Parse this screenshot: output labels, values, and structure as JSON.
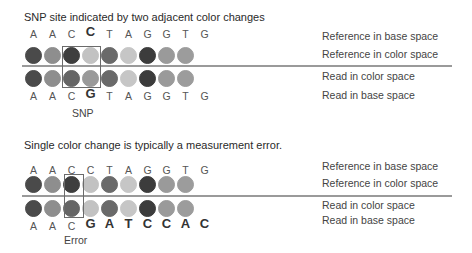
{
  "panels": [
    {
      "title": "SNP site indicated by two adjacent color changes",
      "ref_bases": [
        {
          "b": "A",
          "big": false
        },
        {
          "b": "A",
          "big": false
        },
        {
          "b": "C",
          "big": false
        },
        {
          "b": "C",
          "big": true
        },
        {
          "b": "T",
          "big": false
        },
        {
          "b": "A",
          "big": false
        },
        {
          "b": "G",
          "big": false
        },
        {
          "b": "G",
          "big": false
        },
        {
          "b": "T",
          "big": false
        },
        {
          "b": "G",
          "big": false
        }
      ],
      "ref_colors": [
        "#4a4a4a",
        "#8e8e8e",
        "#3e3e3e",
        "#c2c2c2",
        "#6a6a6a",
        "#c6c6c6",
        "#3c3c3c",
        "#9a9a9a",
        "#9c9c9c"
      ],
      "read_colors": [
        "#4a4a4a",
        "#8e8e8e",
        "#666666",
        "#9a9a9a",
        "#6a6a6a",
        "#c6c6c6",
        "#3c3c3c",
        "#9a9a9a",
        "#9c9c9c"
      ],
      "read_bases": [
        {
          "b": "A",
          "big": false
        },
        {
          "b": "A",
          "big": false
        },
        {
          "b": "C",
          "big": false
        },
        {
          "b": "G",
          "big": true
        },
        {
          "b": "T",
          "big": false
        },
        {
          "b": "A",
          "big": false
        },
        {
          "b": "G",
          "big": false
        },
        {
          "b": "G",
          "big": false
        },
        {
          "b": "T",
          "big": false
        },
        {
          "b": "G",
          "big": false
        }
      ],
      "caption": "SNP",
      "labels": {
        "ref_base": "Reference in base space",
        "ref_color": "Reference in color space",
        "read_color": "Read in color space",
        "read_base": "Read in base space"
      }
    },
    {
      "title": "Single color change is typically a measurement error.",
      "ref_bases": [
        {
          "b": "A",
          "big": false
        },
        {
          "b": "A",
          "big": false
        },
        {
          "b": "C",
          "big": false
        },
        {
          "b": "C",
          "big": false
        },
        {
          "b": "T",
          "big": false
        },
        {
          "b": "A",
          "big": false
        },
        {
          "b": "G",
          "big": false
        },
        {
          "b": "G",
          "big": false
        },
        {
          "b": "T",
          "big": false
        },
        {
          "b": "G",
          "big": false
        }
      ],
      "ref_colors": [
        "#4a4a4a",
        "#8e8e8e",
        "#3e3e3e",
        "#c2c2c2",
        "#6a6a6a",
        "#c6c6c6",
        "#3c3c3c",
        "#9a9a9a",
        "#9c9c9c"
      ],
      "read_colors": [
        "#4a4a4a",
        "#8e8e8e",
        "#666666",
        "#c2c2c2",
        "#6a6a6a",
        "#c6c6c6",
        "#3c3c3c",
        "#9a9a9a",
        "#9c9c9c"
      ],
      "read_bases": [
        {
          "b": "A",
          "big": false
        },
        {
          "b": "A",
          "big": false
        },
        {
          "b": "C",
          "big": false
        },
        {
          "b": "G",
          "big": true
        },
        {
          "b": "A",
          "big": true
        },
        {
          "b": "T",
          "big": true
        },
        {
          "b": "C",
          "big": true
        },
        {
          "b": "C",
          "big": true
        },
        {
          "b": "A",
          "big": true
        },
        {
          "b": "C",
          "big": true
        }
      ],
      "caption": "Error",
      "labels": {
        "ref_base": "Reference in base space",
        "ref_color": "Reference in color space",
        "read_color": "Read in color space",
        "read_base": "Read in base space"
      }
    }
  ],
  "colors": {
    "line": "#9a9a9a",
    "box": "#6b6b6b",
    "background": "#ffffff"
  }
}
